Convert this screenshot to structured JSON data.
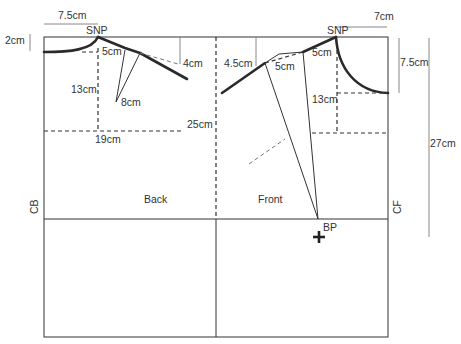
{
  "diagram": {
    "panels": {
      "back": "Back",
      "front": "Front"
    },
    "edges": {
      "center_back": "CB",
      "center_front": "CF"
    },
    "points": {
      "back_snp": "SNP",
      "front_snp": "SNP",
      "bust_point": "BP"
    },
    "measurements": {
      "back_neck_width": "7.5cm",
      "back_neck_depth": "2cm",
      "back_shoulder_to_dart": "5cm",
      "back_shoulder_drop": "4cm",
      "back_dart_length": "8cm",
      "back_armhole_depth": "13cm",
      "back_width": "19cm",
      "armhole_depth_total": "25cm",
      "front_neck_width": "7cm",
      "front_neck_depth": "7.5cm",
      "front_shoulder_drop": "4.5cm",
      "front_shoulder_seg_outer": "5cm",
      "front_shoulder_seg_inner": "5cm",
      "front_armhole_depth": "13cm",
      "front_length": "27cm"
    },
    "colors": {
      "line": "#333333",
      "guide": "#888888",
      "bold": "#2a2a2a",
      "background": "#ffffff"
    }
  }
}
